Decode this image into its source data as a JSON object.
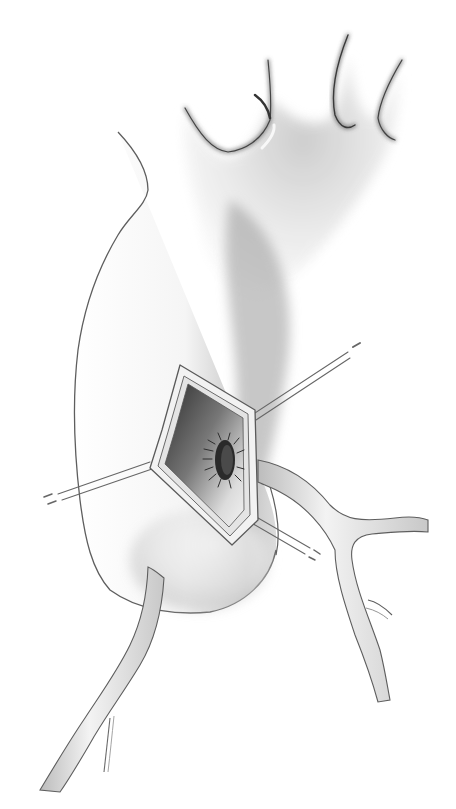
{
  "image": {
    "kind": "grayscale surgical illustration",
    "subject": "aortic arch and descending aorta with a diamond-shaped aortotomy held open by stay sutures, exposing a sutured circular anastomosis on the inner wall",
    "colors": {
      "background": "#ffffff",
      "outline": "#5a5a5a",
      "shadow": "#8a8a8a",
      "lumen_dark": "#3a3a3a",
      "vessel_fill": "#eeeeee"
    },
    "elements": [
      "aortic-arch",
      "arch-branch-vessels",
      "aortotomy-window",
      "sutured-anastomosis",
      "stay-sutures",
      "right-branch-artery",
      "lower-branch-artery"
    ],
    "caption": ""
  }
}
